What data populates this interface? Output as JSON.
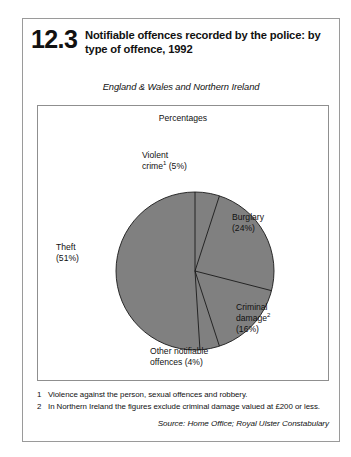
{
  "figure": {
    "number": "12.3",
    "title": "Notifiable offences recorded by the police: by type of offence, 1992",
    "subtitle": "England & Wales and Northern Ireland",
    "units": "Percentages"
  },
  "labels": {
    "violent_crime_line1": "Violent",
    "violent_crime_name": "crime",
    "violent_crime_footnote_ref": "1",
    "violent_crime_value": " (5%)",
    "burglary_line1": "Burglary",
    "burglary_line2": "(24%)",
    "criminal_damage_line1": "Criminal",
    "criminal_damage_name": "damage",
    "criminal_damage_footnote_ref": "2",
    "criminal_damage_value": "(16%)",
    "other_line1": "Other notifiable",
    "other_line2": "offences (4%)",
    "theft_line1": "Theft",
    "theft_line2": "(51%)"
  },
  "footnotes": [
    {
      "marker": "1",
      "text": "Violence against the person, sexual offences and robbery."
    },
    {
      "marker": "2",
      "text": "In Northern Ireland the figures exclude criminal damage valued at £200 or less."
    }
  ],
  "source": "Source: Home Office; Royal Ulster Constabulary",
  "colors": {
    "pie_fill": "#808080",
    "pie_stroke": "#1a1a1a",
    "frame_border": "#9a9a9a",
    "panel_border": "#8f8f8f",
    "text": "#111111"
  },
  "chart_data": {
    "type": "pie",
    "title": "Notifiable offences recorded by the police: by type of offence, 1992",
    "subtitle": "England & Wales and Northern Ireland",
    "ylabel": "Percentages",
    "legend": "none",
    "grid": false,
    "start_angle_deg": 90,
    "direction": "clockwise",
    "categories": [
      "Violent crime",
      "Burglary",
      "Criminal damage",
      "Other notifiable offences",
      "Theft"
    ],
    "values": [
      5,
      24,
      16,
      4,
      51
    ],
    "units": "percent",
    "slice_fill": "#808080",
    "slice_labels": [
      "Violent crime¹ (5%)",
      "Burglary (24%)",
      "Criminal damage² (16%)",
      "Other notifiable offences (4%)",
      "Theft (51%)"
    ]
  }
}
